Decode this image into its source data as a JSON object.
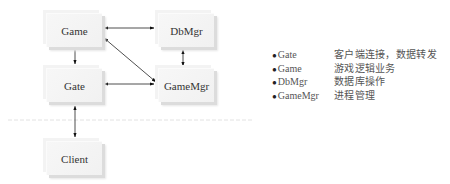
{
  "diagram": {
    "nodes": [
      {
        "id": "game",
        "label": "Game"
      },
      {
        "id": "dbmgr",
        "label": "DbMgr"
      },
      {
        "id": "gate",
        "label": "Gate"
      },
      {
        "id": "gamemgr",
        "label": "GameMgr"
      },
      {
        "id": "client",
        "label": "Client"
      }
    ],
    "edges": [
      {
        "from": "game",
        "to": "dbmgr",
        "direction": "both"
      },
      {
        "from": "game",
        "to": "gate",
        "direction": "forward"
      },
      {
        "from": "game",
        "to": "gamemgr",
        "direction": "both"
      },
      {
        "from": "dbmgr",
        "to": "gamemgr",
        "direction": "both"
      },
      {
        "from": "gate",
        "to": "gamemgr",
        "direction": "both"
      },
      {
        "from": "gate",
        "to": "client",
        "direction": "both"
      }
    ],
    "divider": "dashed"
  },
  "legend": {
    "bullet": "●",
    "items": [
      {
        "name": "Gate",
        "desc": "客户端连接，数据转发"
      },
      {
        "name": "Game",
        "desc": "游戏逻辑业务"
      },
      {
        "name": "DbMgr",
        "desc": "数据库操作"
      },
      {
        "name": "GameMgr",
        "desc": "进程管理"
      }
    ]
  }
}
